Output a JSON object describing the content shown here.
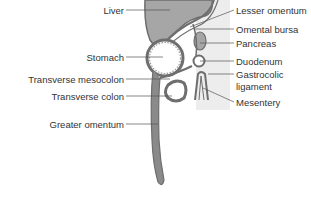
{
  "diagram": {
    "colors": {
      "organ_fill": "#a6a6a6",
      "wall": "#6e6e6e",
      "lumen": "#ffffff",
      "panel": "#ececec",
      "text": "#333333"
    },
    "labels_left": [
      {
        "id": "liver",
        "text": "Liver"
      },
      {
        "id": "stomach",
        "text": "Stomach"
      },
      {
        "id": "transverse-mesocolon",
        "text": "Transverse mesocolon"
      },
      {
        "id": "transverse-colon",
        "text": "Transverse colon"
      },
      {
        "id": "greater-omentum",
        "text": "Greater omentum"
      }
    ],
    "labels_right": [
      {
        "id": "lesser-omentum",
        "text": "Lesser omentum"
      },
      {
        "id": "omental-bursa",
        "text": "Omental bursa"
      },
      {
        "id": "pancreas",
        "text": "Pancreas"
      },
      {
        "id": "duodenum",
        "text": "Duodenum"
      },
      {
        "id": "gastrocolic-ligament",
        "text": "Gastrocolic"
      },
      {
        "id": "gastrocolic-ligament-2",
        "text": "ligament"
      },
      {
        "id": "mesentery",
        "text": "Mesentery"
      }
    ]
  }
}
